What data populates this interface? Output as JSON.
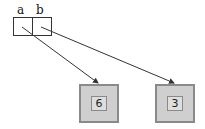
{
  "diagram": {
    "array": {
      "labels": [
        "a",
        "b"
      ]
    },
    "values": [
      {
        "label": "6"
      },
      {
        "label": "3"
      }
    ],
    "colors": {
      "line": "#333333",
      "box_outer": "#cfcfcf",
      "box_border": "#8a8a8a",
      "box_inner": "#dedede"
    }
  }
}
